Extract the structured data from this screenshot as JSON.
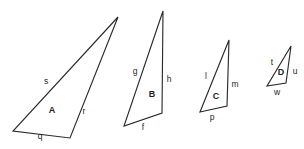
{
  "figure": {
    "background_color": "#ffffff",
    "stroke_color": "#2b2b2b",
    "label_color": "#1f1f1f",
    "canvas": {
      "width": 304,
      "height": 149
    }
  },
  "triangles": [
    {
      "name": "A",
      "interior_label": "A",
      "interior_label_pos": {
        "x": 52,
        "y": 110
      },
      "vertices": [
        {
          "x": 118,
          "y": 17
        },
        {
          "x": 13,
          "y": 131
        },
        {
          "x": 70,
          "y": 138
        }
      ],
      "sides": [
        {
          "label": "s",
          "x": 46,
          "y": 81
        },
        {
          "label": "r",
          "x": 84,
          "y": 111
        },
        {
          "label": "q",
          "x": 40,
          "y": 136
        }
      ]
    },
    {
      "name": "B",
      "interior_label": "B",
      "interior_label_pos": {
        "x": 152,
        "y": 94
      },
      "vertices": [
        {
          "x": 163,
          "y": 11
        },
        {
          "x": 124,
          "y": 126
        },
        {
          "x": 162,
          "y": 113
        }
      ],
      "sides": [
        {
          "label": "g",
          "x": 135,
          "y": 71
        },
        {
          "label": "h",
          "x": 169,
          "y": 79
        },
        {
          "label": "f",
          "x": 143,
          "y": 127
        }
      ]
    },
    {
      "name": "C",
      "interior_label": "C",
      "interior_label_pos": {
        "x": 216,
        "y": 96
      },
      "vertices": [
        {
          "x": 229,
          "y": 40
        },
        {
          "x": 200,
          "y": 112
        },
        {
          "x": 227,
          "y": 106
        }
      ],
      "sides": [
        {
          "label": "l",
          "x": 206,
          "y": 76
        },
        {
          "label": "m",
          "x": 235,
          "y": 84
        },
        {
          "label": "p",
          "x": 212,
          "y": 117
        }
      ]
    },
    {
      "name": "D",
      "interior_label": "D",
      "interior_label_pos": {
        "x": 281,
        "y": 72
      },
      "vertices": [
        {
          "x": 291,
          "y": 46
        },
        {
          "x": 267,
          "y": 86
        },
        {
          "x": 286,
          "y": 83
        }
      ],
      "sides": [
        {
          "label": "t",
          "x": 272,
          "y": 62
        },
        {
          "label": "u",
          "x": 295,
          "y": 71
        },
        {
          "label": "w",
          "x": 277,
          "y": 92
        }
      ]
    }
  ]
}
